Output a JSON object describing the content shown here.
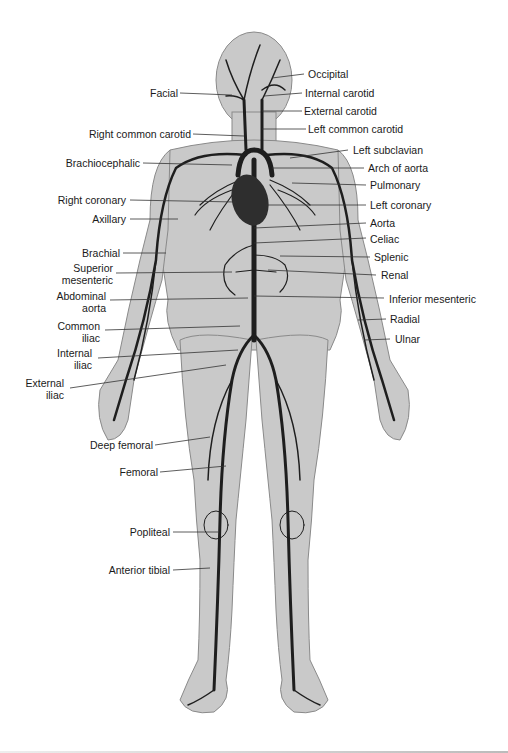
{
  "diagram": {
    "colors": {
      "skin": "#c4c4c4",
      "skin_outline": "#8a8a8a",
      "artery": "#1e1e1e",
      "label_text": "#1a1a1a",
      "leader_line": "#333333"
    },
    "labels_left": [
      {
        "id": "facial",
        "text": "Facial"
      },
      {
        "id": "right-common-carotid",
        "text": "Right common carotid"
      },
      {
        "id": "brachiocephalic",
        "text": "Brachiocephalic"
      },
      {
        "id": "right-coronary",
        "text": "Right coronary"
      },
      {
        "id": "axillary",
        "text": "Axillary"
      },
      {
        "id": "brachial",
        "text": "Brachial"
      },
      {
        "id": "superior-mesenteric",
        "text": "Superior mesenteric"
      },
      {
        "id": "abdominal-aorta",
        "text": "Abdominal aorta"
      },
      {
        "id": "common-iliac",
        "text": "Common iliac"
      },
      {
        "id": "internal-iliac",
        "text": "Internal iliac"
      },
      {
        "id": "external-iliac",
        "text": "External iliac"
      },
      {
        "id": "deep-femoral",
        "text": "Deep femoral"
      },
      {
        "id": "femoral",
        "text": "Femoral"
      },
      {
        "id": "popliteal",
        "text": "Popliteal"
      },
      {
        "id": "anterior-tibial",
        "text": "Anterior tibial"
      }
    ],
    "labels_right": [
      {
        "id": "occipital",
        "text": "Occipital"
      },
      {
        "id": "internal-carotid",
        "text": "Internal carotid"
      },
      {
        "id": "external-carotid",
        "text": "External carotid"
      },
      {
        "id": "left-common-carotid",
        "text": "Left common carotid"
      },
      {
        "id": "left-subclavian",
        "text": "Left subclavian"
      },
      {
        "id": "arch-of-aorta",
        "text": "Arch of aorta"
      },
      {
        "id": "pulmonary",
        "text": "Pulmonary"
      },
      {
        "id": "left-coronary",
        "text": "Left coronary"
      },
      {
        "id": "aorta",
        "text": "Aorta"
      },
      {
        "id": "celiac",
        "text": "Celiac"
      },
      {
        "id": "splenic",
        "text": "Splenic"
      },
      {
        "id": "renal",
        "text": "Renal"
      },
      {
        "id": "inferior-mesenteric",
        "text": "Inferior mesenteric"
      },
      {
        "id": "radial",
        "text": "Radial"
      },
      {
        "id": "ulnar",
        "text": "Ulnar"
      }
    ]
  }
}
